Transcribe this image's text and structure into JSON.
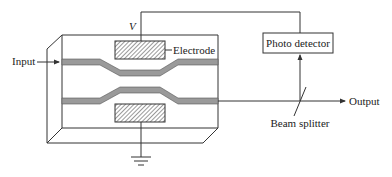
{
  "diagram": {
    "type": "Mach-Zehnder electro-optic modulator with feedback",
    "labels": {
      "input": "Input",
      "output": "Output",
      "electrode": "Electrode",
      "voltage": "V",
      "photo_detector": "Photo detector",
      "beam_splitter": "Beam splitter"
    },
    "components": [
      {
        "id": "substrate",
        "desc": "3D slab (crystal substrate)"
      },
      {
        "id": "top-electrode",
        "desc": "hatched electrode above upper waveguide arm"
      },
      {
        "id": "bottom-electrode",
        "desc": "hatched electrode below lower waveguide arm"
      },
      {
        "id": "upper-waveguide",
        "desc": "upper arm of interferometer"
      },
      {
        "id": "lower-waveguide",
        "desc": "lower arm of interferometer"
      },
      {
        "id": "ground",
        "desc": "ground symbol connected to bottom electrode"
      },
      {
        "id": "photo-detector",
        "desc": "box receiving split output"
      },
      {
        "id": "beam-splitter",
        "desc": "diagonal splitter on output line"
      }
    ],
    "connections": [
      {
        "from": "Input",
        "to": "upper-waveguide"
      },
      {
        "from": "lower-waveguide",
        "to": "beam-splitter"
      },
      {
        "from": "beam-splitter",
        "to": "Output"
      },
      {
        "from": "beam-splitter",
        "to": "photo-detector"
      },
      {
        "from": "photo-detector",
        "to": "top-electrode",
        "label": "V"
      },
      {
        "from": "bottom-electrode",
        "to": "ground"
      }
    ],
    "colors": {
      "line": "#333333",
      "waveguide_fill": "#9a9a9a",
      "hatch": "#555555",
      "background": "#ffffff"
    }
  }
}
